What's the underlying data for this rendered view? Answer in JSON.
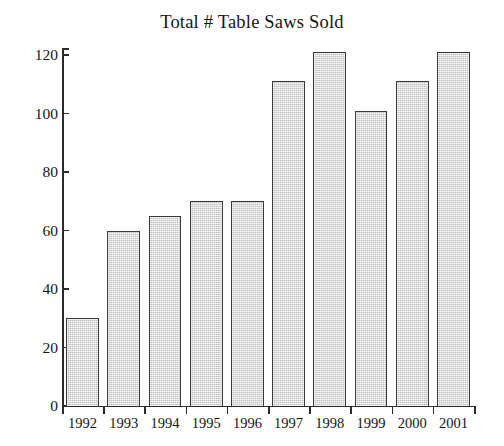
{
  "chart_data": {
    "type": "bar",
    "title": "Total # Table Saws Sold",
    "xlabel": "",
    "ylabel": "",
    "categories": [
      "1992",
      "1993",
      "1994",
      "1995",
      "1996",
      "1997",
      "1998",
      "1999",
      "2000",
      "2001"
    ],
    "values": [
      30,
      60,
      65,
      70,
      70,
      111,
      121,
      101,
      111,
      121
    ],
    "ylim": [
      0,
      125
    ],
    "yticks": [
      0,
      20,
      40,
      60,
      80,
      100,
      120
    ],
    "ytick_labels": [
      "0",
      "20",
      "40",
      "60",
      "80",
      "100",
      "120"
    ],
    "grid": false,
    "legend": null,
    "bar_fill_color": "#d9d9d9",
    "bar_border_color": "#3a3a3a",
    "axis_color": "#2b2b2b",
    "background_color": "#ffffff"
  }
}
